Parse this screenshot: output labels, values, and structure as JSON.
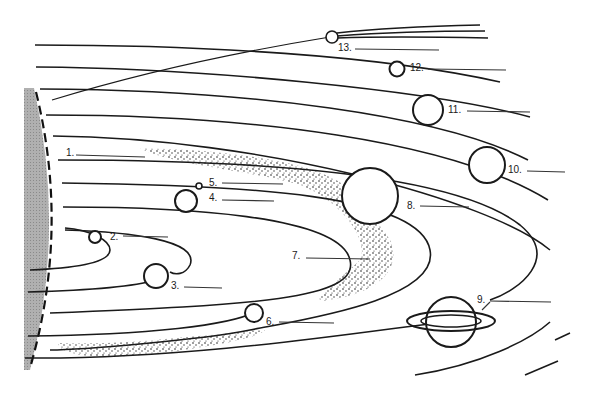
{
  "diagram": {
    "title": "",
    "colors": {
      "ink": "#1a1a1a",
      "sun_fill": "#a9a9a9",
      "background": "#ffffff"
    },
    "labels": [
      {
        "id": 1,
        "text": "1.",
        "x": 66,
        "y": 156
      },
      {
        "id": 2,
        "text": "2.",
        "x": 110,
        "y": 239
      },
      {
        "id": 3,
        "text": "3.",
        "x": 171,
        "y": 288
      },
      {
        "id": 4,
        "text": "4.",
        "x": 209,
        "y": 200
      },
      {
        "id": 5,
        "text": "5.",
        "x": 209,
        "y": 185
      },
      {
        "id": 6,
        "text": "6.",
        "x": 266,
        "y": 324
      },
      {
        "id": 7,
        "text": "7.",
        "x": 292,
        "y": 258
      },
      {
        "id": 8,
        "text": "8.",
        "x": 407,
        "y": 208
      },
      {
        "id": 9,
        "text": "9.",
        "x": 477,
        "y": 302
      },
      {
        "id": 10,
        "text": "10.",
        "x": 508,
        "y": 172
      },
      {
        "id": 11,
        "text": "11.",
        "x": 448,
        "y": 112
      },
      {
        "id": 12,
        "text": "12.",
        "x": 410,
        "y": 70
      },
      {
        "id": 13,
        "text": "13.",
        "x": 338,
        "y": 50
      }
    ],
    "objects": [
      {
        "name": "sun",
        "shading": "gray",
        "edge": "dashed"
      },
      {
        "name": "planet-2",
        "label": "2."
      },
      {
        "name": "planet-3",
        "label": "3."
      },
      {
        "name": "planet-4",
        "label": "4."
      },
      {
        "name": "moon-5",
        "label": "5."
      },
      {
        "name": "planet-6",
        "label": "6."
      },
      {
        "name": "asteroid-belt-7",
        "label": "7."
      },
      {
        "name": "planet-8",
        "label": "8."
      },
      {
        "name": "ringed-planet-9",
        "label": "9."
      },
      {
        "name": "planet-10",
        "label": "10."
      },
      {
        "name": "planet-11",
        "label": "11."
      },
      {
        "name": "planet-12",
        "label": "12."
      },
      {
        "name": "comet-13",
        "label": "13."
      },
      {
        "name": "belt-1",
        "label": "1."
      }
    ]
  }
}
